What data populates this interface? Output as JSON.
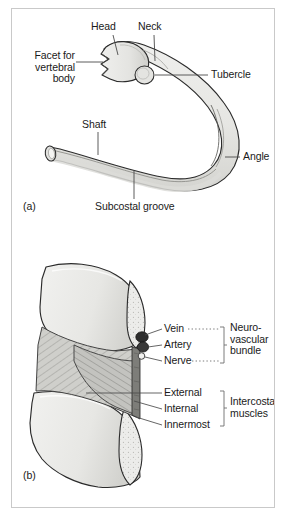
{
  "figure": {
    "panels": [
      {
        "tag": "(a)",
        "caption_subject": "rib-bone-whole",
        "labels": [
          {
            "id": "head",
            "text": "Head"
          },
          {
            "id": "neck",
            "text": "Neck"
          },
          {
            "id": "facet",
            "text": "Facet for\nvertebral\nbody"
          },
          {
            "id": "tubercle",
            "text": "Tubercle"
          },
          {
            "id": "angle",
            "text": "Angle"
          },
          {
            "id": "shaft",
            "text": "Shaft"
          },
          {
            "id": "subcostal-groove",
            "text": "Subcostal groove"
          }
        ]
      },
      {
        "tag": "(b)",
        "caption_subject": "intercostal-space-cross-section",
        "labels": [
          {
            "id": "vein",
            "text": "Vein"
          },
          {
            "id": "artery",
            "text": "Artery"
          },
          {
            "id": "nerve",
            "text": "Nerve"
          },
          {
            "id": "external",
            "text": "External"
          },
          {
            "id": "internal",
            "text": "Internal"
          },
          {
            "id": "innermost",
            "text": "Innermost"
          }
        ],
        "brackets": [
          {
            "id": "neurovascular-bundle",
            "text": "Neuro-\nvascular\nbundle",
            "members": [
              "Vein",
              "Artery",
              "Nerve"
            ]
          },
          {
            "id": "intercostal-muscles",
            "text": "Intercostal\nmuscles",
            "members": [
              "External",
              "Internal",
              "Innermost"
            ]
          }
        ]
      }
    ]
  },
  "colors": {
    "frame_border": "#c9c9c9",
    "background": "#ffffff",
    "bone_fill": "#e8e8e6",
    "bone_fill_shadow": "#d6d6d3",
    "bone_outline": "#2b2b2b",
    "muscle_outer": "#cfcfcb",
    "muscle_inner": "#bdbdb8",
    "vessel_dark": "#2e2e2e",
    "nerve_light": "#f2f2f0",
    "label_text": "#1a1a1a",
    "leader_line": "#4a4a4a",
    "bracket_line": "#6e6e6e"
  }
}
